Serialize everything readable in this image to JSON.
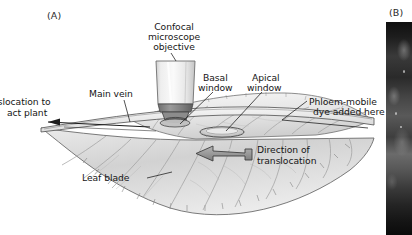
{
  "figure": {
    "panels": [
      {
        "id": "A",
        "label": "(A)",
        "type": "diagram"
      },
      {
        "id": "B",
        "label": "(B)",
        "type": "micrograph"
      }
    ]
  },
  "panel_a": {
    "label": "(A)",
    "annotations": {
      "objective": {
        "line1": "Confocal",
        "line2": "microscope",
        "line3": "objective"
      },
      "main_vein": "Main vein",
      "basal_window": {
        "line1": "Basal",
        "line2": "window"
      },
      "apical_window": {
        "line1": "Apical",
        "line2": "window"
      },
      "dye": {
        "line1": "Phloem-mobile",
        "line2": "dye added here"
      },
      "leaf_blade": "Leaf blade",
      "direction": {
        "line1": "Direction of",
        "line2": "translocation"
      },
      "translocation_out": {
        "line1": "nslocation to",
        "line2": "act plant"
      }
    },
    "colors": {
      "background": "#ffffff",
      "text": "#161616",
      "leader_line": "#1a1a1a",
      "leaf_fill_light": "#f2f2f2",
      "leaf_fill_mid": "#d5d5d5",
      "leaf_fill_dark": "#a8a8a8",
      "vein": "#8e8e8e",
      "objective_light": "#f3f3f3",
      "objective_mid": "#dcdcdc",
      "objective_dark": "#6f6f6f",
      "arrow_fill": "#9a9a9a",
      "arrow_stroke": "#4a4a4a"
    }
  },
  "panel_b": {
    "label": "(B)",
    "description": "grayscale confocal micrograph strip"
  }
}
